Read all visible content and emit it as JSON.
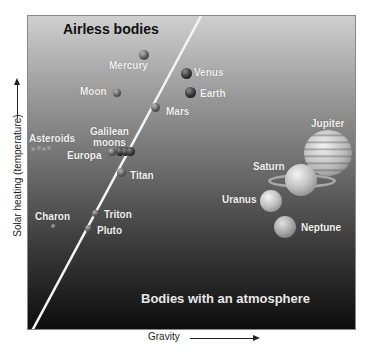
{
  "diagram": {
    "regions": {
      "upper_left": "Airless bodies",
      "lower_right": "Bodies with an atmosphere"
    },
    "axes": {
      "x_label": "Gravity",
      "y_label": "Solar heating (temperature)"
    },
    "bodies": [
      {
        "name": "Mercury",
        "region": "airless"
      },
      {
        "name": "Moon",
        "region": "airless"
      },
      {
        "name": "Asteroids",
        "region": "airless"
      },
      {
        "name": "Galilean moons",
        "region": "boundary"
      },
      {
        "name": "Europa",
        "region": "airless"
      },
      {
        "name": "Charon",
        "region": "airless"
      },
      {
        "name": "Triton",
        "region": "boundary"
      },
      {
        "name": "Pluto",
        "region": "boundary"
      },
      {
        "name": "Venus",
        "region": "atmosphere"
      },
      {
        "name": "Earth",
        "region": "atmosphere"
      },
      {
        "name": "Mars",
        "region": "atmosphere"
      },
      {
        "name": "Titan",
        "region": "atmosphere"
      },
      {
        "name": "Jupiter",
        "region": "atmosphere"
      },
      {
        "name": "Saturn",
        "region": "atmosphere"
      },
      {
        "name": "Uranus",
        "region": "atmosphere"
      },
      {
        "name": "Neptune",
        "region": "atmosphere"
      }
    ]
  },
  "labels": {
    "mercury": "Mercury",
    "moon": "Moon",
    "asteroids": "Asteroids",
    "galilean_1": "Galilean",
    "galilean_2": "moons",
    "europa": "Europa",
    "charon": "Charon",
    "triton": "Triton",
    "pluto": "Pluto",
    "venus": "Venus",
    "earth": "Earth",
    "mars": "Mars",
    "titan": "Titan",
    "jupiter": "Jupiter",
    "saturn": "Saturn",
    "uranus": "Uranus",
    "neptune": "Neptune"
  },
  "colors": {
    "panel_top": "#cfcfcf",
    "panel_bottom": "#0d0d0d",
    "divider_line": "#ffffff"
  }
}
